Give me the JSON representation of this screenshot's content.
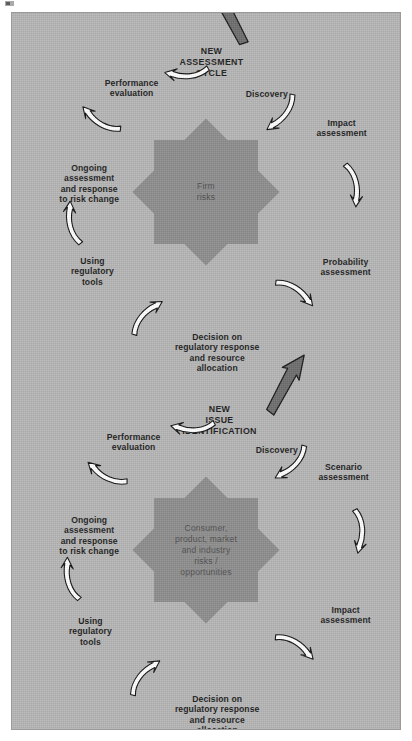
{
  "figure": {
    "background_color": "#b6b6b6",
    "star_color": "#8e8e8e",
    "arrow_color": "#ffffff",
    "dark_arrow_color": "#6b6b6b",
    "rotation_degrees": 90
  },
  "cycles": [
    {
      "id": "firm-risk-cycle",
      "center_label": "Firm\nrisks",
      "entry_label": "NEW\nASSESSMENT\nCYCLE",
      "entry_arrow": "dark-entry-arrow",
      "nodes": [
        {
          "label": "Discovery"
        },
        {
          "label": "Impact\nassessment"
        },
        {
          "label": "Probability\nassessment"
        },
        {
          "label": "Decision on\nregulatory response\nand resource\nallocation"
        },
        {
          "label": "Using\nregulatory\ntools"
        },
        {
          "label": "Ongoing\nassessment\nand response\nto risk change"
        },
        {
          "label": "Performance\nevaluation"
        }
      ]
    },
    {
      "id": "consumer-risk-cycle",
      "center_label": "Consumer,\nproduct, market\nand industry\nrisks /\nopportunities",
      "entry_label": "NEW\nISSUE\nIDENTIFICATION",
      "entry_arrow": "dark-entry-arrow",
      "nodes": [
        {
          "label": "Discovery"
        },
        {
          "label": "Scenario\nassessment"
        },
        {
          "label": "Impact\nassessment"
        },
        {
          "label": "Decision on\nregulatory response\nand resource\nallocation"
        },
        {
          "label": "Using\nregulatory\ntools"
        },
        {
          "label": "Ongoing\nassessment\nand response\nto risk change"
        },
        {
          "label": "Performance\nevaluation"
        }
      ]
    }
  ]
}
